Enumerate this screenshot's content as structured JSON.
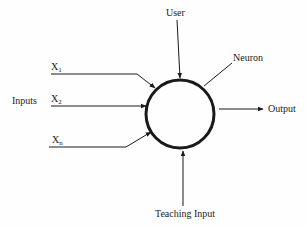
{
  "diagram": {
    "colors": {
      "background": "#fefefe",
      "stroke": "#1a1a1a"
    },
    "neuron": {
      "label": "Neuron",
      "center": [
        180,
        114
      ],
      "radius": 34
    },
    "user": {
      "label": "User"
    },
    "inputs": {
      "group_label": "Inputs",
      "items": [
        {
          "base": "X",
          "sub": "1"
        },
        {
          "base": "X",
          "sub": "2"
        },
        {
          "base": "X",
          "sub": "n"
        }
      ]
    },
    "output": {
      "label": "Output"
    },
    "teaching_input": {
      "label": "Teaching Input"
    }
  }
}
